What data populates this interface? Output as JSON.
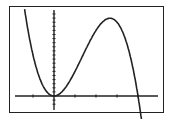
{
  "chart_data": {
    "type": "line",
    "title": "",
    "xlabel": "",
    "ylabel": "",
    "xlim": [
      -2,
      5
    ],
    "ylim": [
      -1.6,
      10.5
    ],
    "x_tick_step": 1,
    "y_tick_step": 0.5,
    "grid": false,
    "series": [
      {
        "name": "f(x)",
        "x": [
          -1.4,
          -1,
          -0.5,
          0,
          0.5,
          1,
          1.5,
          2,
          2.5,
          2.67,
          3,
          3.5,
          4,
          4.1
        ],
        "y": [
          10.6,
          5,
          1.13,
          0,
          0.88,
          3,
          5.63,
          8,
          9.38,
          9.48,
          9,
          6.13,
          0,
          -1.68
        ]
      }
    ],
    "colors": {
      "curve": "#222222",
      "axes": "#222222",
      "frame": "#222222"
    }
  }
}
